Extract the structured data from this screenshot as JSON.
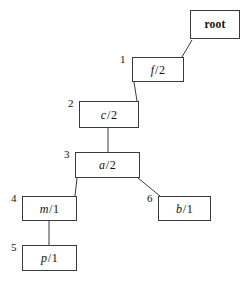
{
  "figure": {
    "type": "tree-diagram",
    "canvas": {
      "width": 249,
      "height": 282
    },
    "stroke_color": "#3a3a3a",
    "text_color": "#111111",
    "background": "#ffffff"
  },
  "nodes": [
    {
      "id": "root",
      "text": "root",
      "italic_part": "",
      "slash": "",
      "number_part": "",
      "index": "",
      "box": {
        "x": 190,
        "y": 10,
        "w": 50,
        "h": 29
      },
      "index_pos": {
        "x": 0,
        "y": 0
      }
    },
    {
      "id": "f",
      "text": "f/2",
      "italic_part": "f",
      "slash": "/",
      "number_part": "2",
      "index": "1",
      "box": {
        "x": 132,
        "y": 57,
        "w": 52,
        "h": 25
      },
      "index_pos": {
        "x": 120,
        "y": 54
      }
    },
    {
      "id": "c",
      "text": "c/2",
      "italic_part": "c",
      "slash": "/",
      "number_part": "2",
      "index": "2",
      "box": {
        "x": 79,
        "y": 101,
        "w": 60,
        "h": 27
      },
      "index_pos": {
        "x": 68,
        "y": 98
      }
    },
    {
      "id": "a",
      "text": "a/2",
      "italic_part": "a",
      "slash": "/",
      "number_part": "2",
      "index": "3",
      "box": {
        "x": 75,
        "y": 152,
        "w": 65,
        "h": 26
      },
      "index_pos": {
        "x": 64,
        "y": 149
      }
    },
    {
      "id": "m",
      "text": "m/1",
      "italic_part": "m",
      "slash": "/",
      "number_part": "1",
      "index": "4",
      "box": {
        "x": 22,
        "y": 196,
        "w": 55,
        "h": 25
      },
      "index_pos": {
        "x": 11,
        "y": 193
      }
    },
    {
      "id": "b",
      "text": "b/1",
      "italic_part": "b",
      "slash": "/",
      "number_part": "1",
      "index": "6",
      "box": {
        "x": 158,
        "y": 196,
        "w": 53,
        "h": 25
      },
      "index_pos": {
        "x": 147,
        "y": 193
      }
    },
    {
      "id": "p",
      "text": "p/1",
      "italic_part": "p",
      "slash": "/",
      "number_part": "1",
      "index": "5",
      "box": {
        "x": 22,
        "y": 245,
        "w": 55,
        "h": 26
      },
      "index_pos": {
        "x": 11,
        "y": 242
      }
    }
  ],
  "edges": [
    {
      "from": "root",
      "to": "f",
      "x1": 192,
      "y1": 40,
      "x2": 182,
      "y2": 57
    },
    {
      "from": "f",
      "to": "c",
      "x1": 134,
      "y1": 82,
      "x2": 137,
      "y2": 101
    },
    {
      "from": "c",
      "to": "a",
      "x1": 108,
      "y1": 128,
      "x2": 108,
      "y2": 152
    },
    {
      "from": "a",
      "to": "m",
      "x1": 77,
      "y1": 178,
      "x2": 75,
      "y2": 196
    },
    {
      "from": "a",
      "to": "b",
      "x1": 138,
      "y1": 178,
      "x2": 160,
      "y2": 196
    },
    {
      "from": "m",
      "to": "p",
      "x1": 49,
      "y1": 221,
      "x2": 49,
      "y2": 245
    }
  ]
}
